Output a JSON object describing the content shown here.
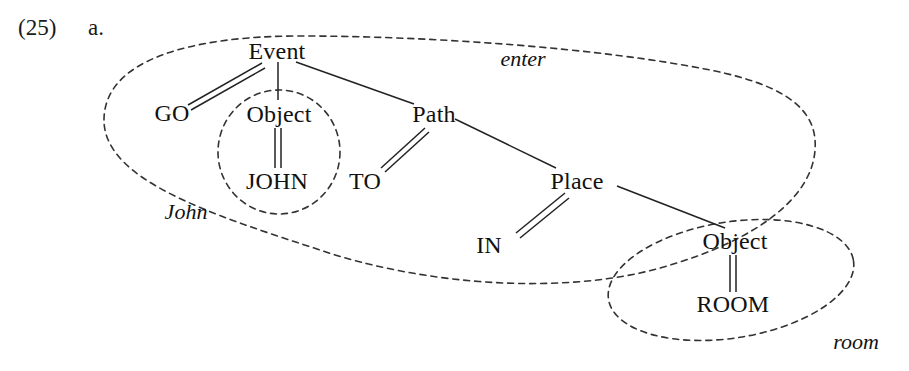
{
  "figure": {
    "example_number": "(25)",
    "sub_label": "a."
  },
  "nodes": {
    "event": "Event",
    "go": "GO",
    "object_agent": "Object",
    "john": "JOHN",
    "path": "Path",
    "to": "TO",
    "place": "Place",
    "in": "IN",
    "object_goal": "Object",
    "room": "ROOM"
  },
  "glosses": {
    "enter": "enter",
    "john": "John",
    "room": "room"
  },
  "colors": {
    "ink": "#1a1a1a",
    "line": "#222222",
    "dashed": "#333333",
    "background": "#ffffff"
  }
}
